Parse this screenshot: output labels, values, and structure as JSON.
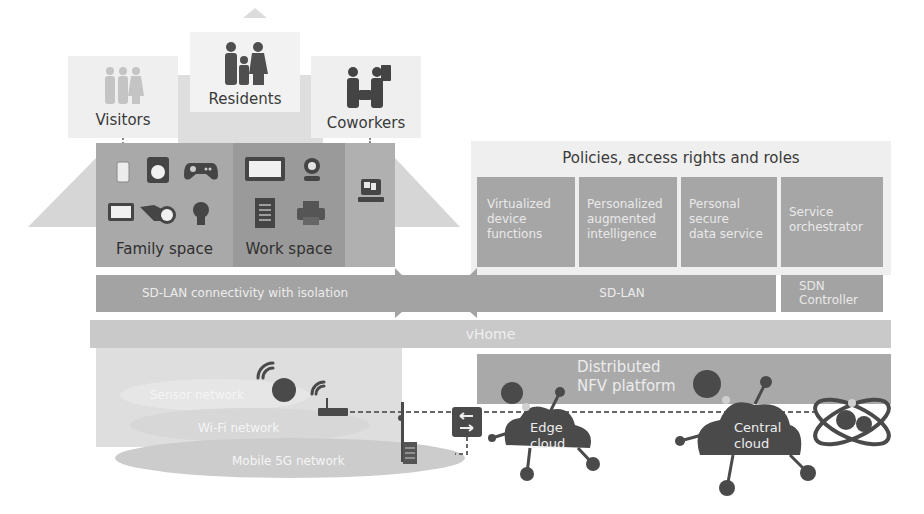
{
  "colors": {
    "house_light": "#d9d9d9",
    "house_mid": "#bdbdbd",
    "family_space": "#a8a8a8",
    "work_space": "#999999",
    "service_box": "#a5a5a5",
    "sdlan_bar": "#a3a3a3",
    "vhome_bar": "#c9c9c9",
    "nfv_bar": "#a9a9a9",
    "icon_dark": "#454545",
    "cloud_dark": "#4a4a4a"
  },
  "user_groups": {
    "visitors": {
      "label": "Visitors",
      "icon": "visitors-people-icon"
    },
    "residents": {
      "label": "Residents",
      "icon": "family-people-icon"
    },
    "coworkers": {
      "label": "Coworkers",
      "icon": "coworkers-people-icon"
    }
  },
  "spaces": {
    "family": {
      "label": "Family space",
      "devices": [
        "smartphone-icon",
        "washing-machine-icon",
        "game-controller-icon",
        "tv-icon",
        "camera-icon",
        "light-bulb-icon"
      ]
    },
    "work": {
      "label": "Work space",
      "devices": [
        "monitor-icon",
        "webcam-icon",
        "document-icon",
        "printer-icon"
      ]
    },
    "coworker_device": "laptop-icon"
  },
  "policies": {
    "title": "Policies, access rights and roles",
    "services": [
      {
        "label": "Virtualized device functions",
        "lines": [
          "Virtualized",
          "device",
          "functions"
        ]
      },
      {
        "label": "Personalized augmented intelligence",
        "lines": [
          "Personalized",
          "augmented",
          "intelligence"
        ]
      },
      {
        "label": "Personal secure data service",
        "lines": [
          "Personal",
          "secure",
          "data service"
        ]
      },
      {
        "label": "Service orchestrator",
        "lines": [
          "Service",
          "orchestrator"
        ]
      }
    ]
  },
  "layers": {
    "sdlan_local": "SD-LAN connectivity with isolation",
    "sdlan_cloud": "SD-LAN",
    "sdn_controller": [
      "SDN",
      "Controller"
    ],
    "vhome": "vHome",
    "nfv": [
      "Distributed",
      "NFV platform"
    ]
  },
  "networks": {
    "sensor": "Sensor network",
    "wifi": "Wi-Fi network",
    "mobile": "Mobile 5G network"
  },
  "clouds": {
    "edge": [
      "Edge",
      "cloud"
    ],
    "central": [
      "Central",
      "cloud"
    ]
  }
}
